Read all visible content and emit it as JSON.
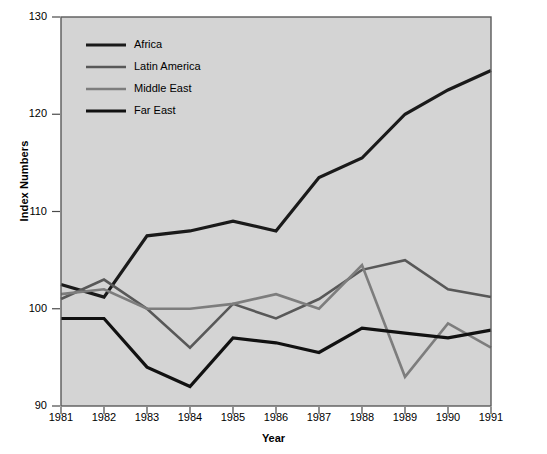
{
  "chart_data": {
    "type": "line",
    "title": "",
    "xlabel": "Year",
    "ylabel": "Index Numbers",
    "x": [
      1981,
      1982,
      1983,
      1984,
      1985,
      1986,
      1987,
      1988,
      1989,
      1990,
      1991
    ],
    "categories": [
      "1981",
      "1982",
      "1983",
      "1984",
      "1985",
      "1986",
      "1987",
      "1988",
      "1989",
      "1990",
      "1991"
    ],
    "xlim": [
      1981,
      1991
    ],
    "ylim": [
      90,
      130
    ],
    "yticks": [
      90,
      100,
      110,
      120,
      130
    ],
    "ytick_labels": [
      "90",
      "100",
      "110",
      "120",
      "130"
    ],
    "grid": false,
    "legend_position": "upper-left-inside",
    "plot_background": "#d4d4d4",
    "figure_background": "#ffffff",
    "series": [
      {
        "name": "Africa",
        "color": "#1a1a1a",
        "width": 3.2,
        "values": [
          102.5,
          101.2,
          107.5,
          108.0,
          109.0,
          108.0,
          113.5,
          115.5,
          120.0,
          122.5,
          124.5
        ]
      },
      {
        "name": "Latin America",
        "color": "#585858",
        "width": 2.6,
        "values": [
          101.0,
          103.0,
          100.0,
          96.0,
          100.5,
          99.0,
          101.0,
          104.0,
          105.0,
          102.0,
          101.2
        ]
      },
      {
        "name": "Middle East",
        "color": "#7d7d7d",
        "width": 2.6,
        "values": [
          101.5,
          102.0,
          100.0,
          100.0,
          100.5,
          101.5,
          100.0,
          104.5,
          93.0,
          98.5,
          96.0
        ]
      },
      {
        "name": "Far East",
        "color": "#111111",
        "width": 3.2,
        "values": [
          99.0,
          99.0,
          94.0,
          92.0,
          97.0,
          96.5,
          95.5,
          98.0,
          97.5,
          97.0,
          97.8
        ]
      }
    ]
  }
}
